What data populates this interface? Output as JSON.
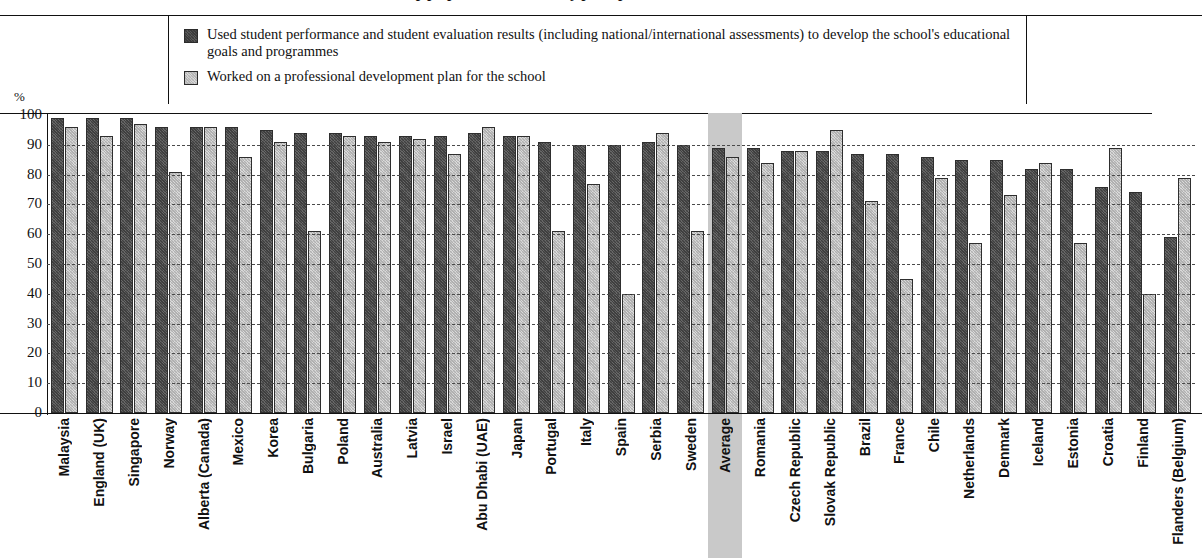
{
  "title": {
    "text_fragment": "related to school leadership preparation and the way principals work"
  },
  "legend": {
    "items": [
      {
        "swatch": "dark",
        "label": "Used student performance and student evaluation results (including national/international assessments) to develop the school's educational goals and programmes"
      },
      {
        "swatch": "light",
        "label": "Worked on a professional development plan for the school"
      }
    ]
  },
  "axis": {
    "unit": "%",
    "ticks": [
      "100",
      "90",
      "80",
      "70",
      "60",
      "50",
      "40",
      "30",
      "20",
      "10",
      "0"
    ]
  },
  "chart_data": {
    "type": "bar",
    "title": "",
    "xlabel": "",
    "ylabel": "%",
    "ylim": [
      0,
      100
    ],
    "grid": true,
    "legend_position": "top",
    "highlight_category": "Average",
    "colors": {
      "series1": "#555555",
      "series2": "#c6c6c6",
      "highlight_band": "#c9c9c9"
    },
    "categories": [
      "Malaysia",
      "England (UK)",
      "Singapore",
      "Norway",
      "Alberta (Canada)",
      "Mexico",
      "Korea",
      "Bulgaria",
      "Poland",
      "Australia",
      "Latvia",
      "Israel",
      "Abu Dhabi (UAE)",
      "Japan",
      "Portugal",
      "Italy",
      "Spain",
      "Serbia",
      "Sweden",
      "Average",
      "Romania",
      "Czech Republic",
      "Slovak Republic",
      "Brazil",
      "France",
      "Chile",
      "Netherlands",
      "Denmark",
      "Iceland",
      "Estonia",
      "Croatia",
      "Finland",
      "Flanders (Belgium)"
    ],
    "series": [
      {
        "name": "Used student performance and student evaluation results (including national/international assessments) to develop the school's educational goals and programmes",
        "swatch": "dark",
        "values": [
          99,
          99,
          99,
          96,
          96,
          96,
          95,
          94,
          94,
          93,
          93,
          93,
          94,
          93,
          91,
          90,
          90,
          91,
          90,
          89,
          89,
          88,
          88,
          87,
          87,
          86,
          85,
          85,
          82,
          82,
          76,
          74,
          59
        ]
      },
      {
        "name": "Worked on a professional development plan for the school",
        "swatch": "light",
        "values": [
          96,
          93,
          97,
          81,
          96,
          86,
          91,
          61,
          93,
          91,
          92,
          87,
          96,
          93,
          61,
          77,
          40,
          94,
          61,
          86,
          84,
          88,
          95,
          71,
          45,
          79,
          57,
          73,
          84,
          57,
          89,
          40,
          79
        ]
      }
    ]
  }
}
